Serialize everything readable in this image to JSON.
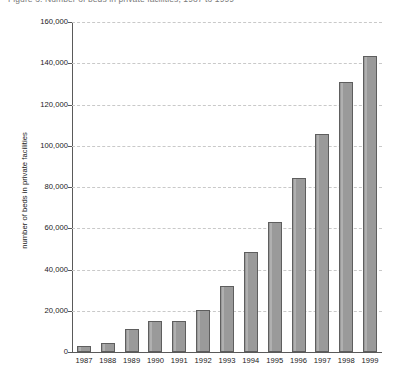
{
  "figure": {
    "cut_off_title": "Figure 3. Number of beds in private facilities, 1987 to 1999"
  },
  "chart_data": {
    "type": "bar",
    "title": "",
    "xlabel": "",
    "ylabel": "number of beds in private facilities",
    "categories": [
      "1987",
      "1988",
      "1989",
      "1990",
      "1991",
      "1992",
      "1993",
      "1994",
      "1995",
      "1996",
      "1997",
      "1998",
      "1999"
    ],
    "values": [
      3000,
      4500,
      11000,
      15000,
      15000,
      20500,
      32000,
      48500,
      63000,
      84500,
      105500,
      131000,
      143500
    ],
    "ylim": [
      0,
      160000
    ],
    "ytick_values": [
      0,
      20000,
      40000,
      60000,
      80000,
      100000,
      120000,
      140000,
      160000
    ],
    "ytick_labels": [
      "0",
      "20,000",
      "40,000",
      "60,000",
      "80,000",
      "100,000",
      "120,000",
      "140,000",
      "160,000"
    ],
    "grid": true,
    "grid_axis": "y",
    "grid_style": "dashed",
    "legend": false,
    "bar_color": "#9a9a9a",
    "bar_edge_color": "#5e5e5e",
    "axis_color": "#5a5a5a",
    "grid_color": "#c9c9c9"
  }
}
